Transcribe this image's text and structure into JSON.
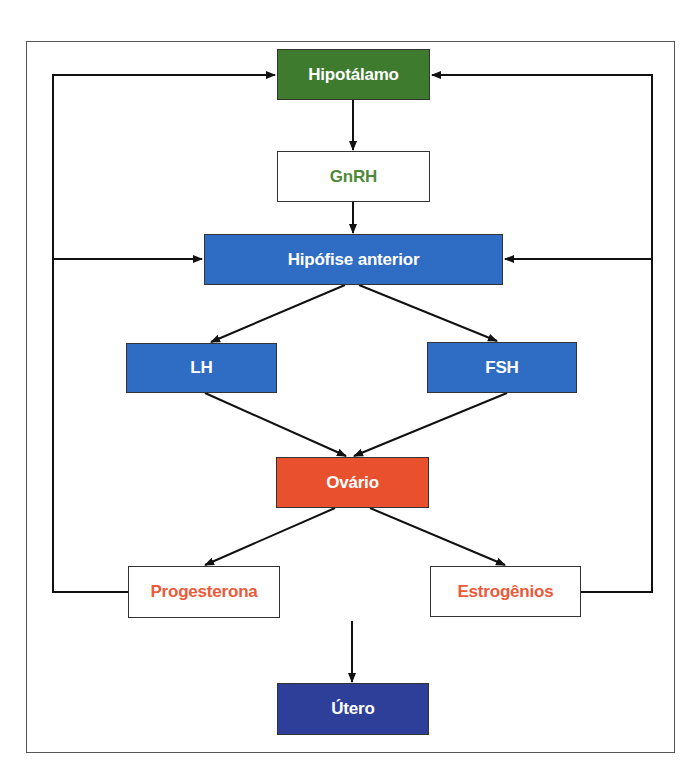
{
  "diagram": {
    "type": "flowchart",
    "nodes": {
      "hipotalamo": {
        "label": "Hipotálamo",
        "fill": "#3e7b2f",
        "text_color": "#ffffff"
      },
      "gnrh": {
        "label": "GnRH",
        "fill": "#ffffff",
        "text_color": "#4f8a3a"
      },
      "hipofise": {
        "label": "Hipófise anterior",
        "fill": "#2f6cc4",
        "text_color": "#ffffff"
      },
      "lh": {
        "label": "LH",
        "fill": "#2f6cc4",
        "text_color": "#ffffff"
      },
      "fsh": {
        "label": "FSH",
        "fill": "#2f6cc4",
        "text_color": "#ffffff"
      },
      "ovario": {
        "label": "Ovário",
        "fill": "#e8502e",
        "text_color": "#ffffff"
      },
      "progesterona": {
        "label": "Progesterona",
        "fill": "#ffffff",
        "text_color": "#ec5a3a"
      },
      "estrogenios": {
        "label": "Estrogênios",
        "fill": "#ffffff",
        "text_color": "#ec5a3a"
      },
      "utero": {
        "label": "Útero",
        "fill": "#2e3f9a",
        "text_color": "#ffffff"
      }
    },
    "edges": [
      {
        "from": "Hipotálamo",
        "to": "GnRH"
      },
      {
        "from": "GnRH",
        "to": "Hipófise anterior"
      },
      {
        "from": "Hipófise anterior",
        "to": "LH"
      },
      {
        "from": "Hipófise anterior",
        "to": "FSH"
      },
      {
        "from": "LH",
        "to": "Ovário"
      },
      {
        "from": "FSH",
        "to": "Ovário"
      },
      {
        "from": "Ovário",
        "to": "Progesterona"
      },
      {
        "from": "Ovário",
        "to": "Estrogênios"
      },
      {
        "from": "Progesterona",
        "to": "Hipotálamo",
        "kind": "feedback"
      },
      {
        "from": "Progesterona",
        "to": "Hipófise anterior",
        "kind": "feedback"
      },
      {
        "from": "Estrogênios",
        "to": "Hipotálamo",
        "kind": "feedback"
      },
      {
        "from": "Estrogênios",
        "to": "Hipófise anterior",
        "kind": "feedback"
      },
      {
        "from": "Ovário hormones",
        "to": "Útero"
      }
    ]
  }
}
